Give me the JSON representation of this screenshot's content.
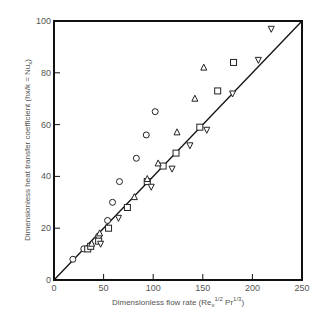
{
  "chart_data": {
    "type": "scatter",
    "title": "",
    "xlabel": "Dimensionless flow rate (Re_x^1/2 Pr^1/3)",
    "xlabel_parts": {
      "main": "Dimensionless flow rate (Re",
      "sub": "x",
      "sup1": "1/2",
      "mid": " Pr",
      "sup2": "1/3",
      "end": ")"
    },
    "ylabel": "Dimensionless heat transfer coefficient (hx/k = Nu_x)",
    "ylabel_parts": {
      "main": "Dimensionless heat transfer coefficient (hx/k = Nu",
      "sub": "x",
      "end": ")"
    },
    "xlim": [
      0,
      250
    ],
    "ylim": [
      0,
      100
    ],
    "xticks": [
      0,
      50,
      100,
      150,
      200,
      250
    ],
    "yticks": [
      0,
      20,
      40,
      60,
      80,
      100
    ],
    "grid": false,
    "legend": null,
    "reference_line": {
      "name": "y = 0.4x",
      "from": [
        0,
        0
      ],
      "to": [
        250,
        100
      ]
    },
    "series": [
      {
        "name": "circles",
        "marker": "circle",
        "points": [
          [
            19,
            8
          ],
          [
            30,
            12
          ],
          [
            45,
            17
          ],
          [
            54,
            23
          ],
          [
            59,
            30
          ],
          [
            66,
            38
          ],
          [
            83,
            47
          ],
          [
            93,
            56
          ],
          [
            102,
            65
          ]
        ]
      },
      {
        "name": "squares",
        "marker": "square",
        "points": [
          [
            34,
            12
          ],
          [
            37,
            13
          ],
          [
            45,
            15
          ],
          [
            55,
            20
          ],
          [
            74,
            28
          ],
          [
            94,
            38
          ],
          [
            110,
            44
          ],
          [
            123,
            49
          ],
          [
            147,
            59
          ],
          [
            165,
            73
          ],
          [
            181,
            84
          ]
        ]
      },
      {
        "name": "triangles-up",
        "marker": "triangle-up",
        "points": [
          [
            38,
            14
          ],
          [
            46,
            18
          ],
          [
            81,
            32
          ],
          [
            94,
            39
          ],
          [
            105,
            45
          ],
          [
            124,
            57
          ],
          [
            142,
            70
          ],
          [
            151,
            82
          ]
        ]
      },
      {
        "name": "triangles-down",
        "marker": "triangle-down",
        "points": [
          [
            47,
            14
          ],
          [
            65,
            24
          ],
          [
            98,
            36
          ],
          [
            119,
            43
          ],
          [
            137,
            52
          ],
          [
            154,
            58
          ],
          [
            180,
            72
          ],
          [
            206,
            85
          ],
          [
            219,
            97
          ]
        ]
      }
    ]
  },
  "colors": {
    "axis": "#111111",
    "marker": "#222222",
    "text": "#555555",
    "background": "#ffffff"
  }
}
